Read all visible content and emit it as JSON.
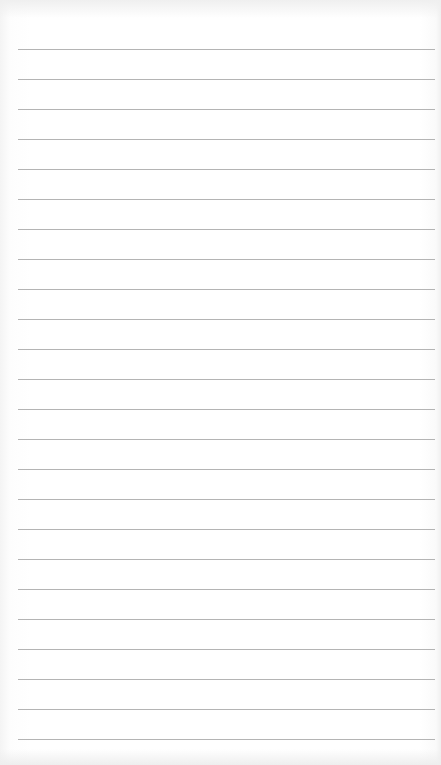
{
  "paper": {
    "type": "lined-notepad",
    "line_count": 24,
    "line_color": "#b4b4b4",
    "background_color": "#ffffff",
    "first_line_y": 49,
    "line_spacing": 30
  }
}
